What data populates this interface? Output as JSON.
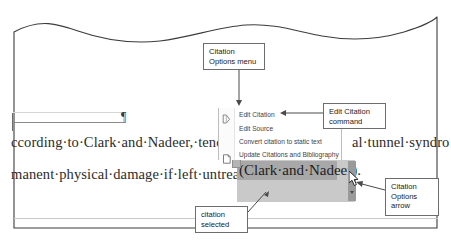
{
  "document": {
    "line1_left": "ccording·to·Clark·and·Nadeer,·tendoni",
    "line1_right": "al·tunnel·syndro",
    "line2_left": "manent·physical·damage·if·left·untreated·",
    "pilcrow": "¶",
    "citation_text": "(Clark·and·Nadeer)."
  },
  "context_menu": {
    "name": "Citation Options menu",
    "items": [
      {
        "label": "Edit Citation",
        "icon": "pencil-edit-icon",
        "enabled": true
      },
      {
        "label": "Edit Source",
        "icon": "none",
        "enabled": true
      },
      {
        "label": "Convert citation to static text",
        "icon": "none",
        "enabled": true
      },
      {
        "label": "Update Citations and Bibliography",
        "icon": "document-refresh-icon",
        "enabled": true
      }
    ]
  },
  "callouts": {
    "citation_options_menu": "Citation\nOptions menu",
    "edit_citation_command": "Edit Citation\ncommand",
    "citation_options_arrow": "Citation\nOptions\narrow",
    "citation_selected": "citation\nselected"
  },
  "colors": {
    "page_background": "#ffffff",
    "frame_stroke": "#3c3c3c",
    "callout_border": "#6d6d6d",
    "selection_fill": "#a8a8a8",
    "field_shading": "#c9c9c9",
    "field_handle": "#9a9a9a",
    "menu_text": "#3f3f3f",
    "doc_text": "#2b2b2b",
    "annotation_line": "#4a4a4a"
  }
}
